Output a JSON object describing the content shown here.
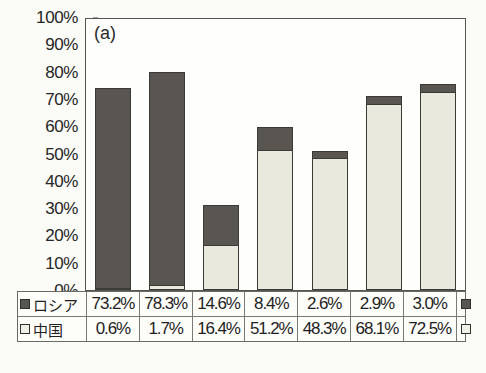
{
  "chart_data": {
    "type": "bar",
    "subtype": "stacked-column",
    "title": "",
    "panel_label": "(a)",
    "xlabel": "",
    "ylabel": "",
    "ylim": [
      0,
      100
    ],
    "ytick_labels": [
      "100%",
      "90%",
      "80%",
      "70%",
      "60%",
      "50%",
      "40%",
      "30%",
      "20%",
      "10%",
      "0%"
    ],
    "ytick_values": [
      100,
      90,
      80,
      70,
      60,
      50,
      40,
      30,
      20,
      10,
      0
    ],
    "grid": false,
    "legend_position": "table-row-labels",
    "categories": [
      "1989",
      "1990",
      "1995",
      "2000",
      "2005",
      "2006",
      "2007"
    ],
    "series": [
      {
        "name": "中国",
        "name_en": "China",
        "color": "#e9e9de",
        "stack_order": "bottom",
        "values": [
          0.6,
          1.7,
          16.4,
          51.2,
          48.3,
          68.1,
          72.5
        ],
        "labels": [
          "0.6%",
          "1.7%",
          "16.4%",
          "51.2%",
          "48.3%",
          "68.1%",
          "72.5%"
        ]
      },
      {
        "name": "ロシア",
        "name_en": "Russia",
        "color": "#595651",
        "stack_order": "top",
        "values": [
          73.2,
          78.3,
          14.6,
          8.4,
          2.6,
          2.9,
          3.0
        ],
        "labels": [
          "73.2%",
          "78.3%",
          "14.6%",
          "8.4%",
          "2.6%",
          "2.9%",
          "3.0%"
        ]
      }
    ],
    "totals": [
      73.8,
      80.0,
      31.0,
      59.6,
      50.9,
      71.0,
      75.5
    ]
  },
  "table": {
    "year_header": [
      "1989",
      "1990",
      "1995",
      "2000",
      "2005",
      "2006",
      "2007"
    ],
    "rows": [
      {
        "label": "ロシア",
        "marker": "dark-square-icon",
        "values": [
          "73.2%",
          "78.3%",
          "14.6%",
          "8.4%",
          "2.6%",
          "2.9%",
          "3.0%"
        ]
      },
      {
        "label": "中国",
        "marker": "light-square-icon",
        "values": [
          "0.6%",
          "1.7%",
          "16.4%",
          "51.2%",
          "48.3%",
          "68.1%",
          "72.5%"
        ]
      }
    ]
  },
  "colors": {
    "russia": "#595651",
    "china": "#e9e9de",
    "outline": "#3b3a36",
    "page_background": "#fbfbf7"
  }
}
